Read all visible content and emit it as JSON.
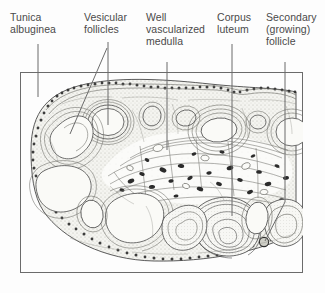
{
  "figure": {
    "kind": "histology-diagram",
    "frame": {
      "x": 20,
      "y": 72,
      "width": 283,
      "height": 201,
      "stroke": "#6b6b6b"
    },
    "colors": {
      "text": "#4a4a4a",
      "leader_line": "#6b6b6b",
      "frame": "#6b6b6b",
      "tissue_ink": "#3a3a3a",
      "cortex_stipple": "#cfcfc9",
      "follicle_lumen": "#f2f2ee",
      "background": "#fdfdfd"
    },
    "labels": [
      {
        "id": "tunica-albuginea",
        "text": "Tunica\nalbuginea",
        "line1": "Tunica",
        "line2": "albuginea",
        "x": 10,
        "y": 11
      },
      {
        "id": "vesicular-follicles",
        "text": "Vesicular\nfollicles",
        "line1": "Vesicular",
        "line2": "follicles",
        "x": 84,
        "y": 11
      },
      {
        "id": "well-vascularized-medulla",
        "text": "Well\nvascularized\nmedulla",
        "line1": "Well",
        "line2": "vascularized",
        "line3": "medulla",
        "x": 146,
        "y": 11
      },
      {
        "id": "corpus-luteum",
        "text": "Corpus\nluteum",
        "line1": "Corpus",
        "line2": "luteum",
        "x": 217,
        "y": 11
      },
      {
        "id": "secondary-growing-follicle",
        "text": "Secondary\n(growing)\nfollicle",
        "line1": "Secondary",
        "line2": "(growing)",
        "line3": "follicle",
        "x": 266,
        "y": 11
      }
    ],
    "leaders": [
      {
        "id": "leader-tunica-albuginea",
        "points": "38,44 38,97"
      },
      {
        "id": "leader-vesicular-follicle-a",
        "points": "108,42 108,125"
      },
      {
        "id": "leader-vesicular-follicle-b",
        "points": "107,48 70,134"
      },
      {
        "id": "leader-medulla",
        "points": "167,62 167,150"
      },
      {
        "id": "leader-corpus-luteum",
        "points": "232,44 232,216"
      },
      {
        "id": "leader-secondary-follicle",
        "points": "285,62 285,202 265,241"
      }
    ]
  }
}
